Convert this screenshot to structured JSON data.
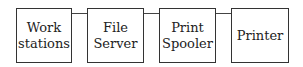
{
  "diagram": {
    "nodes": [
      {
        "id": "workstations",
        "label_line1": "Work",
        "label_line2": "stations"
      },
      {
        "id": "file-server",
        "label_line1": "File",
        "label_line2": "Server"
      },
      {
        "id": "print-spooler",
        "label_line1": "Print",
        "label_line2": "Spooler"
      },
      {
        "id": "printer",
        "label_line1": "Printer",
        "label_line2": ""
      }
    ],
    "edges": [
      {
        "from": "workstations",
        "to": "file-server"
      },
      {
        "from": "file-server",
        "to": "print-spooler"
      },
      {
        "from": "print-spooler",
        "to": "printer"
      }
    ]
  }
}
